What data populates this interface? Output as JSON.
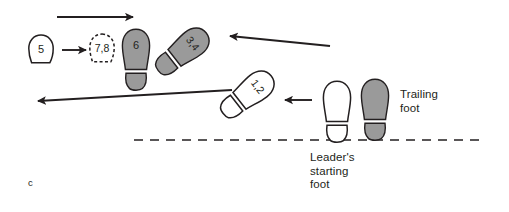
{
  "figure": {
    "panel_label": "c",
    "type": "footwork-step-diagram"
  },
  "colors": {
    "stroke": "#231f20",
    "filled_footprint": "#9a9a9a",
    "open_footprint": "#ffffff",
    "background": "#ffffff",
    "text": "#231f20"
  },
  "labels": {
    "trailing_foot": "Trailing\nfoot",
    "leaders_starting_foot": "Leader's\nstarting\nfoot"
  },
  "footprints": [
    {
      "id": "step-5",
      "label": "5",
      "style": "outline-solid",
      "shape": "heel-only",
      "fill": "#ffffff",
      "rotation_deg": 0,
      "x": 27,
      "y": 34
    },
    {
      "id": "step-7-8",
      "label": "7,8",
      "style": "outline-dashed",
      "shape": "heel-only",
      "fill": "#ffffff",
      "rotation_deg": 0,
      "x": 88,
      "y": 33
    },
    {
      "id": "step-6",
      "label": "6",
      "style": "filled",
      "shape": "full-foot",
      "fill": "#9a9a9a",
      "rotation_deg": 0,
      "x": 121,
      "y": 28
    },
    {
      "id": "step-3-4",
      "label": "3,4",
      "style": "filled",
      "shape": "full-foot",
      "fill": "#9a9a9a",
      "rotation_deg": 52,
      "x": 167,
      "y": 20
    },
    {
      "id": "step-1-2",
      "label": "1,2",
      "style": "outline-solid",
      "shape": "full-foot",
      "fill": "#ffffff",
      "rotation_deg": 52,
      "x": 232,
      "y": 63
    },
    {
      "id": "leader-starting-foot",
      "label": "",
      "style": "outline-solid",
      "shape": "full-foot",
      "fill": "#ffffff",
      "rotation_deg": 0,
      "x": 322,
      "y": 80
    },
    {
      "id": "trailing-foot",
      "label": "",
      "style": "filled",
      "shape": "full-foot",
      "fill": "#9a9a9a",
      "rotation_deg": 0,
      "x": 360,
      "y": 78
    }
  ],
  "arrows": [
    {
      "id": "arrow-top",
      "direction": "right",
      "x1": 57,
      "y1": 17,
      "x2": 133,
      "y2": 17
    },
    {
      "id": "arrow-5-to-7-8",
      "direction": "right",
      "x1": 62,
      "y1": 50,
      "x2": 86,
      "y2": 50
    },
    {
      "id": "arrow-upper-right",
      "direction": "left",
      "x1": 330,
      "y1": 46,
      "x2": 230,
      "y2": 36
    },
    {
      "id": "arrow-short-center",
      "direction": "left",
      "x1": 312,
      "y1": 100,
      "x2": 285,
      "y2": 100
    },
    {
      "id": "arrow-long-bottom",
      "direction": "left",
      "x1": 232,
      "y1": 90,
      "x2": 38,
      "y2": 101
    }
  ],
  "baseline": {
    "id": "dashed-baseline",
    "style": "dashed",
    "x1": 134,
    "y1": 140,
    "x2": 480,
    "y2": 140
  }
}
